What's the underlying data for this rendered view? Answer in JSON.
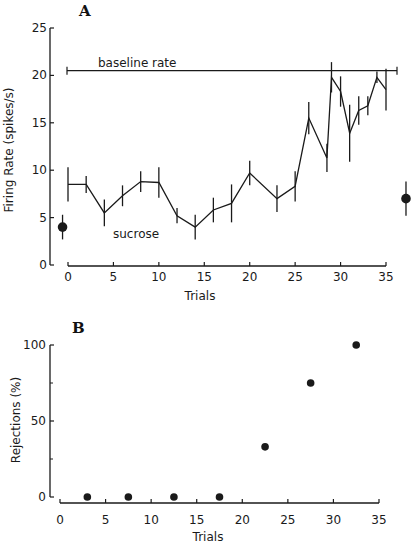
{
  "chart_data": [
    {
      "panel": "A",
      "type": "line",
      "title": "",
      "xlabel": "Trials",
      "ylabel": "Firing Rate (spikes/s)",
      "xlim": [
        0,
        35
      ],
      "ylim": [
        0,
        25
      ],
      "x_ticks": [
        0,
        5,
        10,
        15,
        20,
        25,
        30,
        35
      ],
      "y_ticks": [
        0,
        5,
        10,
        15,
        20,
        25
      ],
      "grid": false,
      "annotations": [
        {
          "text": "baseline rate",
          "type": "horizontal-line",
          "y": 20.5,
          "x_range": [
            0,
            36
          ]
        },
        {
          "text": "sucrose",
          "x": 7,
          "y": 3.2
        }
      ],
      "series": [
        {
          "name": "sucrose",
          "x": [
            0,
            2,
            4,
            6,
            8,
            10,
            12,
            14,
            16,
            18,
            20,
            23,
            25,
            26.5,
            28.5,
            29,
            30,
            31,
            32,
            33,
            34,
            35
          ],
          "y": [
            8.5,
            8.5,
            5.5,
            7.3,
            8.8,
            8.7,
            5.2,
            4.0,
            5.8,
            6.5,
            9.7,
            7.0,
            8.3,
            15.5,
            11.3,
            19.8,
            18.3,
            13.9,
            16.3,
            16.8,
            19.8,
            18.5
          ],
          "error": [
            1.8,
            0.9,
            1.4,
            1.1,
            1.1,
            1.6,
            0.8,
            1.3,
            1.3,
            2.0,
            1.3,
            1.4,
            1.6,
            1.7,
            1.5,
            1.6,
            1.6,
            3.0,
            1.5,
            1.0,
            0.6,
            2.2
          ]
        },
        {
          "name": "pre-control",
          "x": [
            -0.6
          ],
          "y": [
            4.0
          ],
          "error": [
            1.3
          ],
          "marker": "filled-circle"
        },
        {
          "name": "post-control",
          "x": [
            37.2
          ],
          "y": [
            7.0
          ],
          "error": [
            1.8
          ],
          "marker": "filled-circle"
        }
      ]
    },
    {
      "panel": "B",
      "type": "scatter",
      "title": "",
      "xlabel": "Trials",
      "ylabel": "Rejections (%)",
      "xlim": [
        0,
        35
      ],
      "ylim": [
        0,
        100
      ],
      "x_ticks": [
        0,
        5,
        10,
        15,
        20,
        25,
        30,
        35
      ],
      "y_ticks": [
        0,
        50,
        100
      ],
      "y_minor_ticks": [
        25,
        75
      ],
      "grid": false,
      "series": [
        {
          "name": "rejections",
          "x": [
            3,
            7.5,
            12.5,
            17.5,
            22.5,
            27.5,
            32.5
          ],
          "y": [
            0,
            0,
            0,
            0,
            33,
            75,
            100
          ]
        }
      ]
    }
  ],
  "labels": {
    "panel_a": "A",
    "panel_b": "B",
    "a_xlabel": "Trials",
    "a_ylabel": "Firing  Rate  (spikes/s)",
    "b_xlabel": "Trials",
    "b_ylabel": "Rejections   (%)",
    "baseline": "baseline rate",
    "sucrose": "sucrose"
  }
}
